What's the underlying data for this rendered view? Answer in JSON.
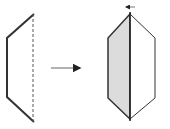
{
  "diagram": {
    "colors": {
      "stroke": "#333333",
      "shade": "#dcdcdc",
      "arrow": "#999999",
      "background": "#ffffff"
    },
    "left_shape": {
      "points": "34,14 7,38 7,97 34,122",
      "fold_line": {
        "x": 33,
        "y1": 14,
        "y2": 122,
        "style": "dashed"
      }
    },
    "transform_arrow": {
      "x1": 51,
      "y1": 68,
      "x2": 82,
      "y2": 68,
      "direction": "right"
    },
    "right_shape": {
      "left_half_points": "130,14 108,38 108,98 130,119",
      "right_half_points": "130,14 155,38 155,98 130,119",
      "axis": {
        "x": 130,
        "y1": 12,
        "y2": 121
      }
    },
    "fold_arrow": {
      "x1": 134,
      "y1": 7,
      "x2": 125,
      "y2": 7,
      "direction": "left"
    }
  }
}
